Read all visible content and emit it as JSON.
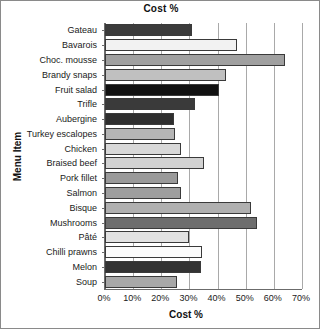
{
  "chart_data": {
    "type": "bar",
    "orientation": "horizontal",
    "title": "Cost %",
    "xlabel": "Cost %",
    "ylabel": "Menu Item",
    "xlim": [
      0,
      70
    ],
    "xticks": [
      0,
      10,
      20,
      30,
      40,
      50,
      60,
      70
    ],
    "xtick_labels": [
      "0%",
      "10%",
      "20%",
      "30%",
      "40%",
      "50%",
      "60%",
      "70%"
    ],
    "grid": true,
    "legend": "none",
    "categories": [
      "Gateau",
      "Bavarois",
      "Choc. mousse",
      "Brandy snaps",
      "Fruit salad",
      "Trifle",
      "Aubergine",
      "Turkey escalopes",
      "Chicken",
      "Braised beef",
      "Pork fillet",
      "Salmon",
      "Bisque",
      "Mushrooms",
      "Pâté",
      "Chilli prawns",
      "Melon",
      "Soup"
    ],
    "values": [
      31,
      47,
      64,
      43,
      40.5,
      32,
      24.5,
      25,
      27,
      35,
      26,
      27,
      52,
      54,
      30,
      34.5,
      34,
      25.5
    ],
    "bar_colors": [
      "#3b3b3b",
      "#f2f2f2",
      "#a0a0a0",
      "#c0c0c0",
      "#111111",
      "#3a3a3a",
      "#2e2e2e",
      "#b5b5b5",
      "#d8d8d8",
      "#d2d2d2",
      "#9a9a9a",
      "#9e9e9e",
      "#b0b0b0",
      "#6e6e6e",
      "#e2e2e2",
      "#fbfbfb",
      "#333333",
      "#a8a8a8"
    ]
  },
  "axis": {
    "grid_color": "#a9a9a9",
    "axis_color": "#6b6b6b"
  }
}
